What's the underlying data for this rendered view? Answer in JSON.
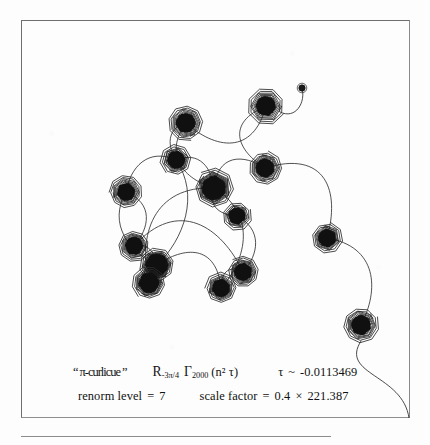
{
  "figure": {
    "kind": "curlicue-exponential-sum-plot",
    "caption_line1": {
      "label_quoted": "“ π-curlicue ”",
      "operator_R": "R",
      "operator_R_subscript": "-3π/4",
      "gamma_symbol": "Γ",
      "gamma_subscript": "2000",
      "gamma_argument": "(n² τ)",
      "tau_symbol": "τ",
      "tau_relation": "~",
      "tau_value": "-0.0113469"
    },
    "caption_line2": {
      "renorm_label": "renorm level",
      "renorm_equals": "=",
      "renorm_value": "7",
      "scale_label": "scale factor",
      "scale_equals": "=",
      "scale_value_a": "0.4",
      "scale_times": "×",
      "scale_value_b": "221.387"
    },
    "colors": {
      "ink": "#1a1a1a",
      "frame": "#7a7a7a",
      "paper": "#fdfdfd"
    }
  },
  "chart_data": {
    "type": "scatter",
    "title": "π-curlicue",
    "xlabel": "",
    "ylabel": "",
    "grid": false,
    "legend": null,
    "series_name": "R_{-3π/4} Γ_{2000}(n²τ)",
    "parameters": {
      "tau": -0.0113469,
      "N_terms": 2000,
      "rotation": "-3π/4",
      "renorm_level": 7,
      "scale_factor_components": [
        0.4,
        221.387
      ],
      "scale_factor_product": 88.5548
    },
    "spirals": [
      {
        "id": 1,
        "cx": 245,
        "cy": 86,
        "r": 17,
        "turns": 5,
        "core": 8.5,
        "label": "top-right-spiral"
      },
      {
        "id": 2,
        "cx": 165,
        "cy": 103,
        "r": 16,
        "turns": 5,
        "core": 8.5,
        "label": "upper-left-spiral"
      },
      {
        "id": 3,
        "cx": 155,
        "cy": 140,
        "r": 14,
        "turns": 5,
        "core": 7.5,
        "label": "upper-mid-left-spiral"
      },
      {
        "id": 4,
        "cx": 105,
        "cy": 172,
        "r": 15,
        "turns": 5,
        "core": 7.5,
        "label": "left-spiral"
      },
      {
        "id": 5,
        "cx": 193,
        "cy": 168,
        "r": 18,
        "turns": 6,
        "core": 11,
        "label": "center-spiral"
      },
      {
        "id": 6,
        "cx": 244,
        "cy": 148,
        "r": 15,
        "turns": 5,
        "core": 8,
        "label": "right-mid-spiral"
      },
      {
        "id": 7,
        "cx": 216,
        "cy": 196,
        "r": 13,
        "turns": 4,
        "core": 7,
        "label": "center-low-spiral"
      },
      {
        "id": 8,
        "cx": 113,
        "cy": 226,
        "r": 14,
        "turns": 5,
        "core": 7.5,
        "label": "lower-left-spiral"
      },
      {
        "id": 9,
        "cx": 136,
        "cy": 245,
        "r": 16,
        "turns": 6,
        "core": 10,
        "label": "lower-left-big-spiral"
      },
      {
        "id": 10,
        "cx": 128,
        "cy": 263,
        "r": 15,
        "turns": 5,
        "core": 9,
        "label": "bottom-left-spiral"
      },
      {
        "id": 11,
        "cx": 200,
        "cy": 268,
        "r": 14,
        "turns": 5,
        "core": 7.5,
        "label": "bottom-mid-spiral"
      },
      {
        "id": 12,
        "cx": 222,
        "cy": 252,
        "r": 14,
        "turns": 5,
        "core": 7.5,
        "label": "bottom-mid-right-spiral"
      },
      {
        "id": 13,
        "cx": 306,
        "cy": 218,
        "r": 14,
        "turns": 5,
        "core": 7.5,
        "label": "right-lower-spiral"
      },
      {
        "id": 14,
        "cx": 340,
        "cy": 305,
        "r": 16,
        "turns": 5,
        "core": 8.5,
        "label": "far-bottom-right-spiral"
      }
    ],
    "endpoint_dot": {
      "cx": 281,
      "cy": 68,
      "r": 3.2,
      "label": "isolated-endpoint-dot"
    },
    "tail": {
      "from": [
        340,
        321
      ],
      "to": [
        388,
        398
      ],
      "label": "trailing-tail-curve"
    }
  }
}
